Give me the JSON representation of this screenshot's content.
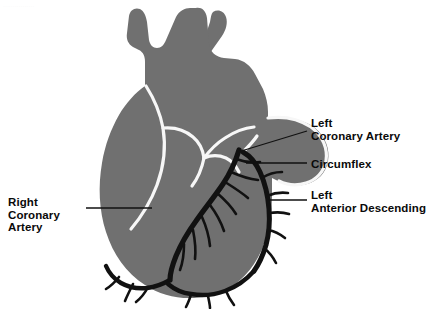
{
  "figure": {
    "background_color": "#ffffff",
    "heart_fill": "#707070",
    "heart_outline": "#f7f7f7",
    "artery_color": "#111111",
    "leader_color": "#111111",
    "text_color": "#0a0a0a",
    "header_artifact": "................"
  },
  "labels": [
    {
      "id": "right-coronary-artery",
      "lines": [
        "Right",
        "Coronary",
        "Artery"
      ],
      "x": 8,
      "y": 196,
      "align": "left"
    },
    {
      "id": "left-coronary-artery",
      "lines": [
        "Left",
        "Coronary Artery"
      ],
      "x": 311,
      "y": 117,
      "align": "left"
    },
    {
      "id": "circumflex",
      "lines": [
        "Circumflex"
      ],
      "x": 311,
      "y": 158,
      "align": "left"
    },
    {
      "id": "left-anterior-descending",
      "lines": [
        "Left",
        "Anterior Descending"
      ],
      "x": 311,
      "y": 189,
      "align": "left"
    }
  ],
  "leader_lines": [
    {
      "id": "leader-right-coronary-artery",
      "points": "86,208 152,208"
    },
    {
      "id": "leader-left-coronary-artery",
      "points": "307,131 238,152"
    },
    {
      "id": "leader-circumflex",
      "points": "307,163 246,163"
    },
    {
      "id": "leader-left-anterior-descending",
      "points": "307,200 268,200"
    }
  ],
  "anatomy": {
    "heart_body": "M196,8 C201,7 206,10 207,18 L209,44 C210,52 216,57 224,58 L235,59 C244,60 251,66 255,74 L263,89 C266,96 268,104 268,112 L268,118 L275,118 C290,117 305,120 315,128 C326,137 330,150 328,161 C326,173 318,181 307,184 C298,187 288,186 280,182 L272,178 L272,196 C272,222 266,246 254,264 C243,281 227,292 208,296 C186,301 163,297 145,285 C126,273 113,254 106,232 C99,210 98,186 102,163 C105,145 111,129 119,115 C126,103 135,93 145,86 L145,62 C145,56 143,52 139,50 L133,47 C128,44 126,39 127,33 L129,16 C130,10 135,7 140,9 C144,11 146,16 147,22 L149,40 C150,45 153,48 157,48 C161,48 164,45 166,40 L176,17 C179,11 185,8 190,8 Z",
    "vessel_upper_right": "M213,12 C218,9 224,11 226,17 C228,23 226,30 222,36 L210,53 L202,46 L210,22 C211,17 211,14 213,12 Z",
    "pulmonary_outline": "M268,118 C283,116 299,119 311,127 C323,136 328,149 326,161 C324,172 316,180 306,183 C297,186 287,185 279,181",
    "septum_outline": "M146,86 C153,97 160,112 163,128 C166,146 164,166 157,185 C151,201 142,216 131,229",
    "valve_line_1": "M163,128 C174,127 185,130 193,137 C199,142 203,150 204,158",
    "valve_line_2": "M204,158 C211,155 219,155 226,158 C232,161 236,166 239,172",
    "valve_line_3": "M204,158 C202,168 198,178 192,186",
    "aorta_outline": "M204,158 C210,150 217,143 225,138 C234,132 244,128 254,127",
    "lca_stem": "M243,152 C248,147 253,142 257,136",
    "arteries": {
      "rca_main": "M239,150 C236,160 231,172 223,184 C215,196 205,208 196,221 C188,232 181,244 176,256 C172,266 170,274 170,280",
      "rca_inferior": "M170,280 C163,284 155,287 147,288 C137,289 128,287 121,283 C114,279 109,273 106,266",
      "lad_main": "M243,152 C250,156 256,163 260,172 C265,183 268,196 269,209 C270,222 269,234 266,245 C263,255 259,264 254,271",
      "pda": "M254,271 C246,280 236,287 225,291 C214,295 202,296 191,294 C182,293 174,289 168,284"
    },
    "branches": [
      "M236,159 C244,162 252,163 260,162",
      "M231,172 C240,176 249,179 258,180",
      "M225,182 C233,187 241,192 248,198",
      "M217,193 C224,199 231,206 236,214",
      "M210,205 C216,213 221,222 224,231",
      "M202,217 C206,226 209,236 210,246",
      "M193,230 C195,240 196,250 195,259",
      "M184,244 C184,253 183,262 180,270",
      "M262,178 C268,174 275,172 282,172",
      "M267,196 C274,193 281,192 288,193",
      "M269,213 C276,212 283,212 289,214",
      "M268,230 C274,231 280,234 285,238",
      "M264,248 C269,252 273,257 276,263",
      "M148,287 C145,293 141,298 136,302",
      "M133,284 C130,290 127,296 125,301",
      "M119,277 C115,282 111,286 106,289",
      "M226,291 C228,296 231,301 234,305",
      "M208,296 C209,301 210,305 210,308",
      "M191,294 C190,299 188,303 186,307"
    ]
  }
}
